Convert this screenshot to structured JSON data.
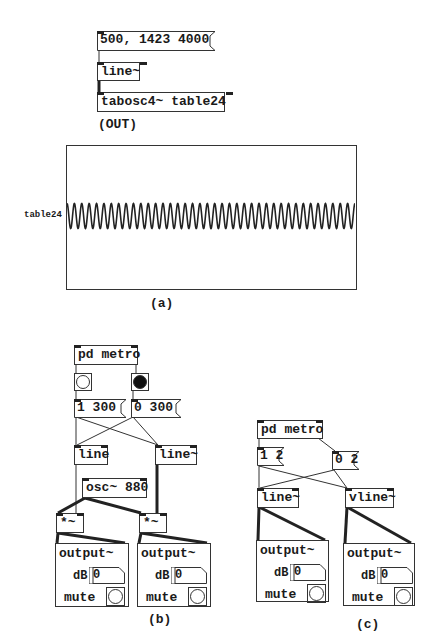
{
  "part_a": {
    "message": "500, 1423 4000",
    "line_obj": "line~",
    "tabosc_obj": "tabosc4~ table24",
    "out_label": "(OUT)",
    "table_name": "table24",
    "caption": "(a)"
  },
  "part_b": {
    "metro": "pd metro",
    "msg_start": "1 300",
    "msg_stop": "0 300",
    "line_ctl": "line",
    "line_sig": "line~",
    "osc": "osc~ 880",
    "mul_left": "*~",
    "mul_right": "*~",
    "outputs": [
      {
        "title": "output~",
        "db_label": "dB",
        "db_value": "0",
        "mute_label": "mute"
      },
      {
        "title": "output~",
        "db_label": "dB",
        "db_value": "0",
        "mute_label": "mute"
      }
    ],
    "bang_left_state": "off",
    "bang_right_state": "on",
    "caption": "(b)"
  },
  "part_c": {
    "metro": "pd metro",
    "msg_start": "1 2",
    "msg_stop": "0 2",
    "line_sig": "line~",
    "vline_sig": "vline~",
    "outputs": [
      {
        "title": "output~",
        "db_label": "dB",
        "db_value": "0",
        "mute_label": "mute"
      },
      {
        "title": "output~",
        "db_label": "dB",
        "db_value": "0",
        "mute_label": "mute"
      }
    ],
    "caption": "(c)"
  },
  "waveform": {
    "cycles": 39,
    "stroke": "#222222"
  }
}
